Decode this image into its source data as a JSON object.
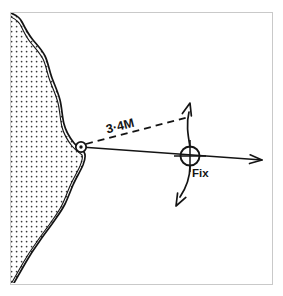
{
  "figure": {
    "background_color": "#ffffff",
    "ink_color": "#141414",
    "border_color": "#c9c9c9",
    "stipple_color": "#3a3a3a"
  },
  "frame": {
    "name": "diagram-border",
    "x": 10,
    "y": 12,
    "width": 262,
    "height": 272,
    "stroke_width": 1
  },
  "landmass": {
    "name": "coastline-landmass",
    "label": "land",
    "fill_pattern": "stipple-dots",
    "dot_spacing": 5,
    "dot_radius": 0.85,
    "outline_style": "double-line",
    "outline_path": "M 11,13 C 18,16 20,18 22,22 C 25,28 28,34 33,40 C 38,46 42,50 45,56 C 48,62 49,70 52,78 C 55,86 58,92 60,100 C 62,108 62,116 64,124 C 66,132 70,138 74,143 C 78,148 82,150 84,152 C 86,155 85,160 83,165 C 80,172 76,178 73,185 C 70,192 68,198 65,204 C 61,212 56,218 52,224 C 47,231 43,236 39,242 C 34,249 30,255 26,262 C 22,269 18,276 14,283",
    "inner_outline_path": "M 11,17 C 17,20 19,22 21,26 C 24,32 26,37 31,43 C 36,49 40,53 43,59 C 46,65 47,73 50,81 C 53,89 56,95 58,103 C 60,111 60,119 62,127 C 64,135 68,141 72,146 C 76,151 80,153 82,155 C 83,157 82,161 80,166 C 77,173 73,179 70,186 C 67,193 65,199 62,205 C 58,213 53,219 49,225 C 44,232 40,237 36,243 C 31,250 27,256 23,263 C 19,270 15,277 11,284"
  },
  "landmark": {
    "name": "landmark-point",
    "label": "charted landmark",
    "x": 81,
    "y": 147,
    "outer_radius": 5.2,
    "inner_radius": 1.7
  },
  "bearing_line": {
    "name": "bearing-line",
    "label": "position line from landmark through fix",
    "from_x": 81,
    "from_y": 147,
    "to_x": 262,
    "to_y": 160,
    "arrow_at_end": true,
    "stroke_width": 1.6
  },
  "range_line": {
    "name": "range-dashed-line",
    "label": "range arc chord to fix ordinate",
    "from_x": 86,
    "from_y": 144,
    "to_x": 189,
    "to_y": 117,
    "dash_pattern": "7 5",
    "stroke_width": 1.8
  },
  "range_label": {
    "name": "range-distance-label",
    "text": "3·4M",
    "x": 121,
    "y": 130,
    "rotation_deg": -14,
    "font_size": 12.5
  },
  "fix": {
    "name": "fix-symbol",
    "label_text": "Fix",
    "x": 190,
    "y": 156,
    "circle_radius": 9.5,
    "cross_arm": 16,
    "label_x": 192,
    "label_y": 177,
    "label_font_size": 11.5
  },
  "arrows": {
    "up": {
      "name": "fix-arrow-up",
      "label": "upward position-line arrow",
      "path": "M 190,147 C 188,135 186,124 189,112",
      "head_x": 190,
      "head_y": 103,
      "head_angle_deg": -75
    },
    "down": {
      "name": "fix-arrow-down",
      "label": "downward position-line arrow",
      "path": "M 190,166 C 190,178 186,188 180,197",
      "head_x": 176,
      "head_y": 206,
      "head_angle_deg": 118
    },
    "right": {
      "name": "bearing-arrow-right",
      "label": "bearing direction arrow",
      "head_x": 262,
      "head_y": 160,
      "head_angle_deg": 4
    }
  }
}
